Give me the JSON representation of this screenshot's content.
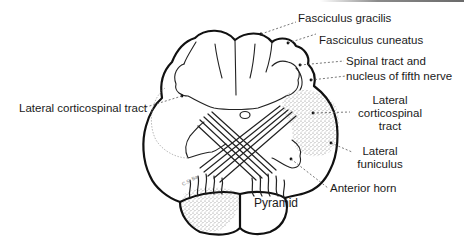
{
  "figure": {
    "type": "anatomical cross-section (medulla / lower brainstem)",
    "colors": {
      "ink": "#111111",
      "stipple": "#9a9a9a",
      "background": "#ffffff"
    }
  },
  "labels": {
    "fasciculus_gracilis": "Fasciculus gracilis",
    "fasciculus_cuneatus": "Fasciculus cuneatus",
    "spinal_tract_line1": "Spinal tract and",
    "spinal_tract_line2": "nucleus of fifth nerve",
    "lateral_cs_left": "Lateral corticospinal tract",
    "lateral_cs_right_line1": "Lateral",
    "lateral_cs_right_line2": "corticospinal",
    "lateral_cs_right_line3": "tract",
    "lateral_funiculus_line1": "Lateral",
    "lateral_funiculus_line2": "funiculus",
    "anterior_horn": "Anterior horn",
    "pyramid": "Pyramid"
  },
  "signature": "C.S. Ba"
}
